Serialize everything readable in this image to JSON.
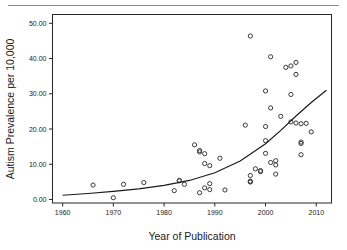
{
  "figure": {
    "background_color": "#ffffff",
    "frame_color": "#262626",
    "point_color": "#3a3a3a",
    "curve_color": "#1a1a1a",
    "rule_color": "#8c8c8c"
  },
  "chart_data": {
    "type": "scatter",
    "title": "",
    "xlabel": "Year of Publication",
    "ylabel": "Autism Prevalence per 10,000",
    "xlim": [
      1958,
      2013
    ],
    "ylim": [
      -1.0,
      52.5
    ],
    "xticks": [
      1960,
      1970,
      1980,
      1990,
      2000,
      2010
    ],
    "xticklabels": [
      "1960",
      "1970",
      "1980",
      "1990",
      "2000",
      "2010"
    ],
    "yticks": [
      0,
      10,
      20,
      30,
      40,
      50
    ],
    "yticklabels": [
      "0.00",
      "10.00",
      "20.00",
      "30.00",
      "40.00",
      "50.00"
    ],
    "grid": false,
    "legend": null,
    "marker": "open-circle",
    "series": [
      {
        "name": "Autism prevalence studies",
        "x": [
          1966,
          1970,
          1972,
          1976,
          1982,
          1983,
          1983,
          1984,
          1986,
          1987,
          1987,
          1987,
          1988,
          1988,
          1988,
          1989,
          1989,
          1989,
          1991,
          1992,
          1996,
          1997,
          1997,
          1997,
          1997,
          1997,
          1998,
          1999,
          1999,
          2000,
          2000,
          2000,
          2000,
          2001,
          2001,
          2001,
          2002,
          2002,
          2002,
          2003,
          2004,
          2005,
          2005,
          2005,
          2006,
          2006,
          2006,
          2007,
          2007,
          2007,
          2007,
          2008,
          2009
        ],
        "y": [
          4.1,
          0.5,
          4.3,
          4.8,
          2.5,
          5.4,
          5.3,
          4.3,
          15.5,
          13.9,
          13.5,
          1.9,
          13.0,
          10.2,
          3.3,
          9.6,
          4.5,
          2.8,
          11.7,
          2.7,
          21.1,
          5.2,
          5.0,
          5.0,
          6.8,
          46.4,
          8.7,
          8.2,
          7.9,
          30.8,
          20.7,
          16.7,
          13.1,
          40.5,
          26.0,
          10.5,
          11.0,
          9.8,
          7.2,
          23.6,
          37.5,
          37.9,
          29.8,
          22.0,
          38.9,
          35.5,
          21.7,
          21.5,
          16.3,
          15.9,
          12.7,
          21.6,
          19.2
        ],
        "marker_style": "open-circle"
      }
    ],
    "fit_curve": {
      "name": "Exponential trend",
      "type": "exponential",
      "description": "Smooth increasing exponential fit from about 1.2 at 1960 rising to about 31 at 2012",
      "points_x": [
        1960,
        1965,
        1970,
        1975,
        1980,
        1985,
        1990,
        1995,
        2000,
        2003,
        2006,
        2009,
        2012
      ],
      "points_y": [
        1.2,
        1.7,
        2.3,
        3.0,
        4.0,
        5.4,
        7.6,
        10.9,
        15.8,
        19.6,
        23.7,
        27.5,
        31.0
      ]
    }
  }
}
